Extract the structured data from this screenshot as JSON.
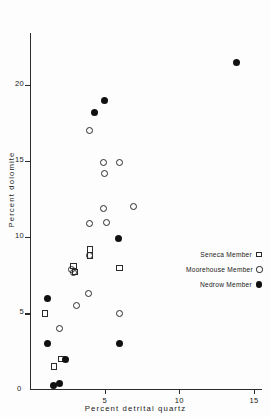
{
  "chart_data": {
    "type": "scatter",
    "title": "",
    "xlabel": "Percent detrital quartz",
    "ylabel": "Percent dolomite",
    "xlim": [
      0,
      15.4
    ],
    "ylim": [
      0,
      23.2
    ],
    "xticks": [
      0,
      5,
      10,
      15
    ],
    "xticklabels": [
      "0",
      "5",
      "10",
      "15"
    ],
    "yticks": [
      0,
      5,
      10,
      15,
      20
    ],
    "yticklabels": [
      "0",
      "5",
      "10",
      "15",
      "20"
    ],
    "grid": false,
    "legend_position": "center-right",
    "series": [
      {
        "name": "Seneca Member",
        "marker": "open-square",
        "color": "#2b2b2b",
        "points": [
          {
            "x": 1.0,
            "y": 5.0
          },
          {
            "x": 1.6,
            "y": 1.5
          },
          {
            "x": 2.1,
            "y": 2.0
          },
          {
            "x": 2.9,
            "y": 8.1
          },
          {
            "x": 3.0,
            "y": 7.7
          },
          {
            "x": 4.0,
            "y": 9.2
          },
          {
            "x": 4.0,
            "y": 8.8
          },
          {
            "x": 6.0,
            "y": 8.0
          }
        ]
      },
      {
        "name": "Moorehouse Member",
        "marker": "open-circle",
        "color": "#2b2b2b",
        "points": [
          {
            "x": 2.0,
            "y": 4.0
          },
          {
            "x": 2.8,
            "y": 7.9
          },
          {
            "x": 2.9,
            "y": 7.7
          },
          {
            "x": 3.1,
            "y": 5.5
          },
          {
            "x": 3.9,
            "y": 6.3
          },
          {
            "x": 4.0,
            "y": 8.8
          },
          {
            "x": 4.0,
            "y": 10.9
          },
          {
            "x": 4.0,
            "y": 17.0
          },
          {
            "x": 4.9,
            "y": 11.9
          },
          {
            "x": 4.9,
            "y": 14.9
          },
          {
            "x": 5.0,
            "y": 14.2
          },
          {
            "x": 5.1,
            "y": 11.0
          },
          {
            "x": 6.0,
            "y": 5.0
          },
          {
            "x": 6.0,
            "y": 14.9
          },
          {
            "x": 6.9,
            "y": 12.0
          }
        ]
      },
      {
        "name": "Nedrow Member",
        "marker": "filled-circle",
        "color": "#111111",
        "points": [
          {
            "x": 1.2,
            "y": 6.0
          },
          {
            "x": 1.2,
            "y": 3.0
          },
          {
            "x": 1.6,
            "y": 0.25
          },
          {
            "x": 2.0,
            "y": 0.4
          },
          {
            "x": 2.4,
            "y": 2.0
          },
          {
            "x": 4.3,
            "y": 18.2
          },
          {
            "x": 5.0,
            "y": 19.0
          },
          {
            "x": 5.9,
            "y": 9.9
          },
          {
            "x": 6.0,
            "y": 3.0
          },
          {
            "x": 13.8,
            "y": 21.5
          }
        ]
      }
    ]
  },
  "legend": {
    "entries": [
      {
        "label": "Seneca Member",
        "key": "open-square-key"
      },
      {
        "label": "Moorehouse Member",
        "key": "open-circle-key"
      },
      {
        "label": "Nedrow Member",
        "key": "filled-circle-key"
      }
    ]
  }
}
